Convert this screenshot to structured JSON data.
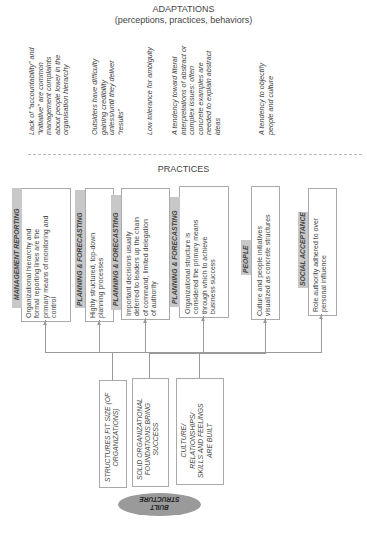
{
  "header": {
    "title": "ADAPTATIONS",
    "subtitle": "(perceptions, practices, behaviors)"
  },
  "adaptations": [
    {
      "lines": [
        "Lack of “accountability” and",
        "“initiative” are common",
        "management complaints",
        "about people lower in the",
        "organisation hierarchy"
      ]
    },
    {
      "lines": [
        "Outsiders have difficulty",
        "gaining credibility",
        "unless/until they deliver",
        "“results”"
      ]
    },
    {
      "lines": [
        "Low tolerance for ambiguity"
      ]
    },
    {
      "lines": [
        "A tendency toward literal",
        "interpretations of abstract or",
        "complex issues; often",
        "concrete examples are",
        "needed to explain abstract",
        "ideas"
      ]
    },
    {
      "lines": [
        "A tendency to objectify",
        "people and culture"
      ]
    }
  ],
  "practices_title": "PRACTICES",
  "practices": [
    {
      "tag": "MANAGEMENT REPORTING",
      "lines": [
        "Organizational hierarchy and",
        "formal reporting lines are the",
        "primary means of monitoring and",
        "control"
      ]
    },
    {
      "tag": "PLANNING & FORECASTING",
      "lines": [
        "Highly structured, top-down",
        "planning processes"
      ]
    },
    {
      "tag": "PLANNING & FORECASTING",
      "lines": [
        "Important decisions usually",
        "deferred to leaders up the chain",
        "of command; limited delegation",
        "of authority"
      ]
    },
    {
      "tag": "PLANNING & FORECASTING",
      "lines": [
        "Organizational structure is",
        "considered the primary means",
        "through which to achieve",
        "business success"
      ]
    },
    {
      "tag": "PEOPLE",
      "lines": [
        "Culture and people initiatives",
        "visualized as concrete structures"
      ]
    },
    {
      "tag": "SOCIAL ACCEPTANCE",
      "lines": [
        "Role authority adhered to over",
        "personal influence"
      ]
    }
  ],
  "beliefs": [
    {
      "lines": [
        "STRUCTURES FIT SIZE (OF",
        "ORGANIZATIONS)"
      ]
    },
    {
      "lines": [
        "SOLID ORGANIZATIONAL",
        "FOUNDATIONS BRING",
        "SUCCESS"
      ]
    },
    {
      "lines": [
        "CULTURE/",
        "RELATIONSHIPS/",
        "SKILLS AND FEELINGS",
        "ARE BUILT"
      ]
    }
  ],
  "core": {
    "lines": [
      "BUILT",
      "STRUCTURE"
    ]
  },
  "colors": {
    "tag_bg": "#c8c8c8",
    "ellipse": "#9a9a9a",
    "line": "#999999",
    "border": "#aaaaaa"
  }
}
